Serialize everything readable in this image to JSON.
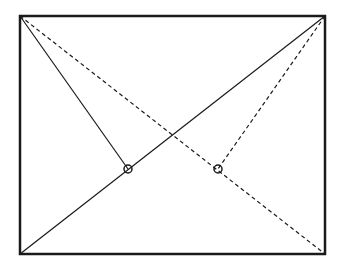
{
  "diagram": {
    "width": 337,
    "height": 270,
    "colors": {
      "stroke": "#1a1a1a",
      "background": "#ffffff"
    },
    "rectangle": {
      "x1": 20,
      "y1": 16,
      "x2": 325,
      "y2": 254
    },
    "solid_lines": [
      {
        "name": "diagonal-bottom-left-to-top-right",
        "x1": 20,
        "y1": 254,
        "x2": 325,
        "y2": 16
      },
      {
        "name": "top-left-to-left-point",
        "x1": 20,
        "y1": 16,
        "x2": 128,
        "y2": 169
      }
    ],
    "dashed_lines": [
      {
        "name": "diagonal-top-left-to-bottom-right",
        "x1": 20,
        "y1": 16,
        "x2": 325,
        "y2": 254
      },
      {
        "name": "top-right-to-right-point",
        "x1": 325,
        "y1": 16,
        "x2": 218,
        "y2": 169
      }
    ],
    "points": [
      {
        "name": "left-point",
        "cx": 128,
        "cy": 169,
        "r": 4
      },
      {
        "name": "right-point",
        "cx": 218,
        "cy": 169,
        "r": 4
      }
    ]
  }
}
